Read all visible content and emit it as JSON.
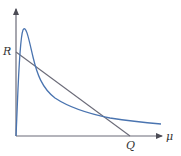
{
  "diagram": {
    "labels": {
      "y_intercept": "R",
      "x_intercept": "Q",
      "x_axis": "μ"
    },
    "colors": {
      "axis": "#6b6b78",
      "line": "#6b6b78",
      "curve": "#4a74b0",
      "text": "#333333"
    },
    "elements": {
      "axes": "x and y axes with arrowheads",
      "straight_line": "line from R on y-axis to Q on x-axis",
      "curve": "skewed distribution curve: rises sharply from origin to a peak near the y-axis, then decays gradually toward the x-axis, crossing the straight line twice"
    }
  }
}
